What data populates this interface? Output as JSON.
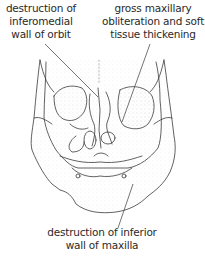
{
  "figure": {
    "type": "anatomical line drawing"
  },
  "labels": {
    "top_left": [
      "destruction of",
      "inferomedial",
      "wall of orbit"
    ],
    "top_right": [
      "gross maxillary",
      "obliteration and soft",
      "tissue thickening"
    ],
    "bottom": [
      "destruction of inferior",
      "wall of maxilla"
    ]
  },
  "colors": {
    "line": "#3a3a3a",
    "text": "#2a2a2a",
    "stipple": "#9a9a9a",
    "background": "#ffffff"
  }
}
